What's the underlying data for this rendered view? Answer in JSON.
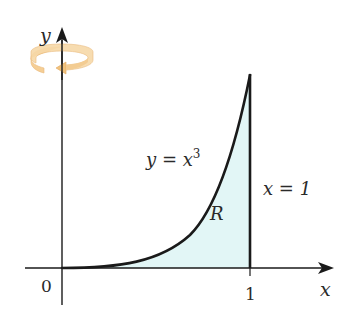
{
  "figure": {
    "axes": {
      "x_label": "x",
      "y_label": "y",
      "origin_label": "0",
      "x_tick_label": "1"
    },
    "curve": {
      "label_lhs": "y = x",
      "label_exp": "3"
    },
    "boundary": {
      "label": "x = 1"
    },
    "region": {
      "label": "R"
    },
    "rotation_icon": {
      "axis": "y-axis"
    },
    "colors": {
      "region_fill": "#e2f6f6",
      "rotation_arrow": "#f4c98a",
      "ink": "#1a1a1a"
    }
  }
}
